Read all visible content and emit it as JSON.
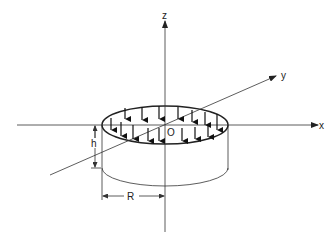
{
  "diagram": {
    "axes": {
      "x_label": "x",
      "y_label": "y",
      "z_label": "z"
    },
    "origin_label": "O",
    "dimensions": {
      "height_label": "h",
      "radius_label": "R"
    },
    "load": {
      "type": "uniform distributed downward pressure",
      "arrow_count": 16
    },
    "colors": {
      "line": "#222222",
      "background": "#ffffff"
    }
  }
}
